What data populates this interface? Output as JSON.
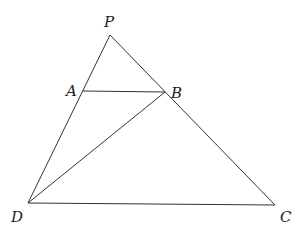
{
  "diagram": {
    "type": "geometry",
    "points": {
      "P": {
        "label": "P",
        "x": 110,
        "y": 35,
        "label_x": 104,
        "label_y": 27
      },
      "A": {
        "label": "A",
        "x": 83,
        "y": 91,
        "label_x": 66,
        "label_y": 96
      },
      "B": {
        "label": "B",
        "x": 165,
        "y": 92,
        "label_x": 171,
        "label_y": 98
      },
      "D": {
        "label": "D",
        "x": 28,
        "y": 203,
        "label_x": 11,
        "label_y": 222
      },
      "C": {
        "label": "C",
        "x": 275,
        "y": 205,
        "label_x": 280,
        "label_y": 222
      }
    },
    "segments": [
      {
        "from": "P",
        "to": "D",
        "name": "segment-pd"
      },
      {
        "from": "P",
        "to": "C",
        "name": "segment-pc"
      },
      {
        "from": "D",
        "to": "C",
        "name": "segment-dc"
      },
      {
        "from": "A",
        "to": "B",
        "name": "segment-ab"
      },
      {
        "from": "D",
        "to": "B",
        "name": "segment-db"
      }
    ],
    "stroke_color": "#333333",
    "label_color": "#222222"
  }
}
